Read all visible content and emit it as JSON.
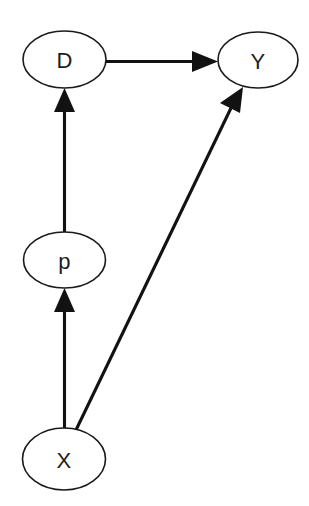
{
  "diagram": {
    "type": "directed-acyclic-graph",
    "title": "",
    "background_color": "#ffffff",
    "stroke_color": "#121212",
    "node_fill_color": "#ffffff",
    "label_color": "#1d1d1d",
    "nodes": [
      {
        "id": "D",
        "label": "D",
        "cx": 64.5,
        "cy": 59.5,
        "rx": 41.5,
        "ry": 28.5
      },
      {
        "id": "Y",
        "label": "Y",
        "cx": 258.0,
        "cy": 60.0,
        "rx": 40.0,
        "ry": 28.0
      },
      {
        "id": "p",
        "label": "p",
        "cx": 64.5,
        "cy": 260.0,
        "rx": 41.0,
        "ry": 28.0
      },
      {
        "id": "X",
        "label": "X",
        "cx": 64.0,
        "cy": 459.0,
        "rx": 41.5,
        "ry": 31.0
      }
    ],
    "edges": [
      {
        "id": "D-to-Y",
        "from": "D",
        "to": "Y",
        "label": "",
        "arrowhead": "filled-triangle",
        "direction": "right"
      },
      {
        "id": "p-to-D",
        "from": "p",
        "to": "D",
        "label": "",
        "arrowhead": "filled-triangle",
        "direction": "up"
      },
      {
        "id": "X-to-p",
        "from": "X",
        "to": "p",
        "label": "",
        "arrowhead": "filled-triangle",
        "direction": "up"
      },
      {
        "id": "X-to-Y",
        "from": "X",
        "to": "Y",
        "label": "",
        "arrowhead": "filled-triangle",
        "direction": "up-right"
      }
    ]
  }
}
